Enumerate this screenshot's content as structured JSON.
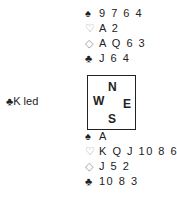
{
  "north": {
    "spades": "9 7 6 4",
    "hearts": "A 2",
    "diamonds": "A Q 6 3",
    "clubs": "J 6 4"
  },
  "south": {
    "spades": "A",
    "hearts": "K Q J 10 8 6",
    "diamonds": "J 5 2",
    "clubs": "10 8 3"
  },
  "compass": {
    "n": "N",
    "w": "W",
    "e": "E",
    "s": "S"
  },
  "lead": {
    "suit_symbol": "♣",
    "text": "K led"
  },
  "symbols": {
    "spades": "♠",
    "hearts": "♡",
    "diamonds": "◇",
    "clubs": "♣"
  },
  "colors": {
    "black_suit": "#222222",
    "red_suit_outline": "#9a9a9a"
  }
}
